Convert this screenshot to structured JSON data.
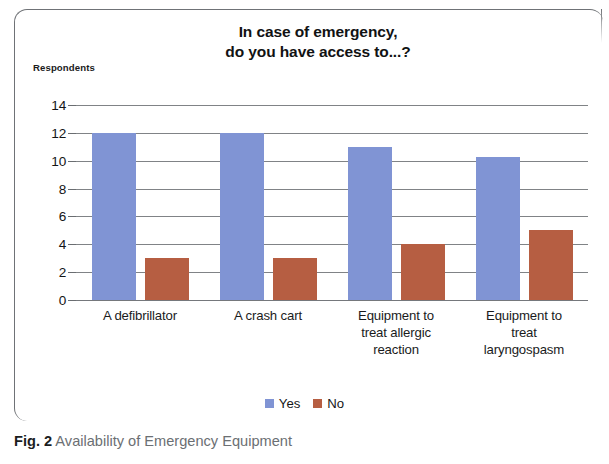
{
  "figure": {
    "caption_number": "Fig. 2",
    "caption_text": "Availability of Emergency Equipment"
  },
  "chart_data": {
    "type": "bar",
    "title": "In case of emergency, do you have access to...?",
    "title_line1": "In case of emergency,",
    "title_line2": "do you have access to...?",
    "xlabel": "",
    "ylabel": "Respondents",
    "ylim": [
      0,
      14
    ],
    "ytick_labels": [
      "0",
      "2",
      "4",
      "6",
      "8",
      "10",
      "12",
      "14"
    ],
    "yticks": [
      0,
      2,
      4,
      6,
      8,
      10,
      12,
      14
    ],
    "grid": "horizontal",
    "legend_position": "bottom",
    "categories": [
      "A defibrillator",
      "A crash cart",
      "Equipment to treat allergic reaction",
      "Equipment to treat laryngospasm"
    ],
    "category_lines": [
      [
        "A defibrillator"
      ],
      [
        "A crash cart"
      ],
      [
        "Equipment to",
        "treat allergic",
        "reaction"
      ],
      [
        "Equipment to",
        "treat",
        "laryngospasm"
      ]
    ],
    "series": [
      {
        "name": "Yes",
        "color": "#8094d4",
        "values": [
          12,
          12,
          11,
          10.3
        ]
      },
      {
        "name": "No",
        "color": "#b65e42",
        "values": [
          3,
          3,
          4,
          5
        ]
      }
    ]
  },
  "colors": {
    "yes_bar": "#8094d4",
    "no_bar": "#b65e42",
    "gridline": "#6a6d71",
    "frame": "#6f7276",
    "caption_text": "#6b6f73",
    "title_text": "#111213"
  }
}
